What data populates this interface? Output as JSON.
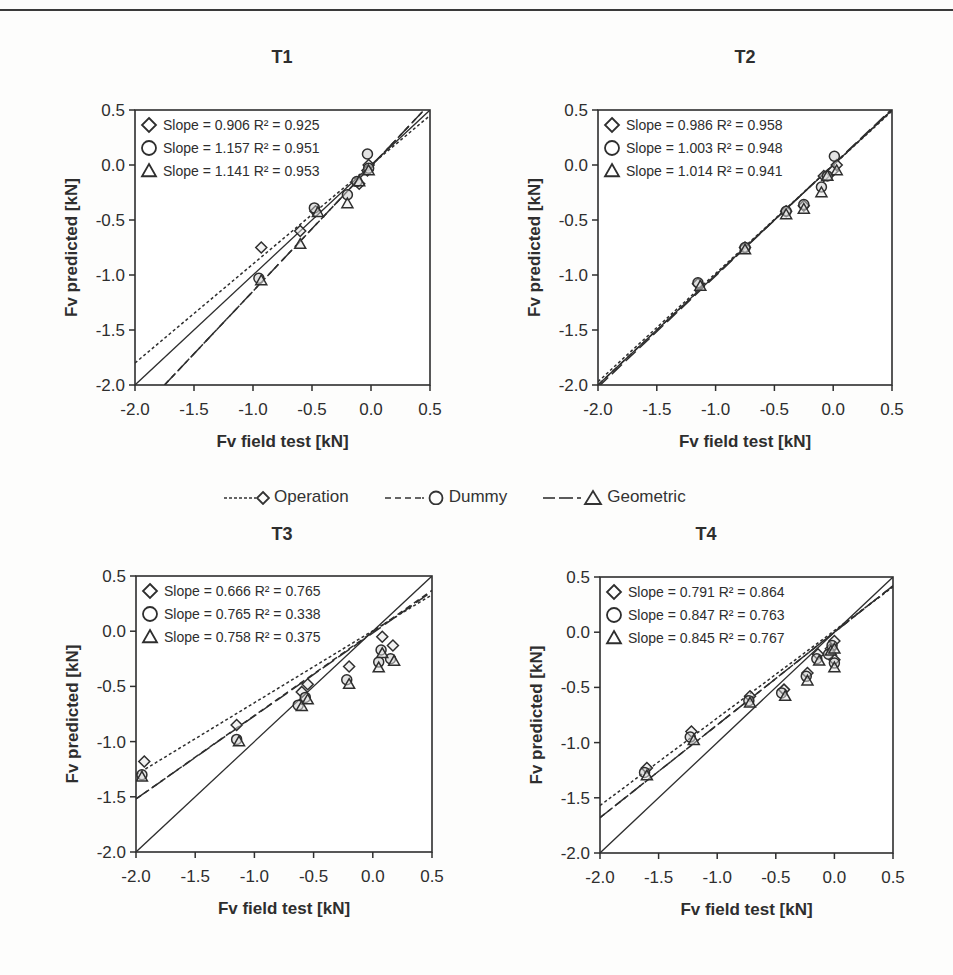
{
  "page": {
    "header_left": "",
    "header_right": ""
  },
  "legend": {
    "items": [
      {
        "label": "Operation",
        "marker": "diamond",
        "line": "short-dash"
      },
      {
        "label": "Dummy",
        "marker": "circle",
        "line": "medium-dash"
      },
      {
        "label": "Geometric",
        "marker": "triangle",
        "line": "long-dash"
      }
    ]
  },
  "chart_data": [
    {
      "type": "scatter",
      "title": "T1",
      "xlabel": "Fv field test [kN]",
      "ylabel": "Fv predicted [kN]",
      "xlim": [
        -2.0,
        0.5
      ],
      "ylim": [
        -2.0,
        0.5
      ],
      "xticks": [
        "-2.0",
        "-1.5",
        "-1.0",
        "-0.5",
        "0.0",
        "0.5"
      ],
      "yticks": [
        "0.5",
        "0.0",
        "-0.5",
        "-1.0",
        "-1.5",
        "-2.0"
      ],
      "grid": false,
      "legend_position": "upper-left inside",
      "series": [
        {
          "name": "Operation",
          "marker": "diamond",
          "slope": 0.906,
          "r2": 0.925,
          "annotation": "Slope = 0.906   R² = 0.925",
          "x": [
            -0.93,
            -0.6,
            -0.47,
            -0.1,
            -0.02,
            -0.03
          ],
          "y": [
            -0.75,
            -0.6,
            -0.42,
            -0.17,
            0.0,
            -0.05
          ]
        },
        {
          "name": "Dummy",
          "marker": "circle",
          "slope": 1.157,
          "r2": 0.951,
          "annotation": "Slope = 1.157   R² = 0.951",
          "x": [
            -0.95,
            -0.48,
            -0.2,
            -0.12,
            -0.03,
            -0.02
          ],
          "y": [
            -1.03,
            -0.39,
            -0.27,
            -0.15,
            0.1,
            -0.03
          ]
        },
        {
          "name": "Geometric",
          "marker": "triangle",
          "slope": 1.141,
          "r2": 0.953,
          "annotation": "Slope = 1.141   R² = 0.953",
          "x": [
            -0.93,
            -0.6,
            -0.45,
            -0.2,
            -0.1,
            -0.02
          ],
          "y": [
            -1.05,
            -0.72,
            -0.43,
            -0.35,
            -0.15,
            -0.05
          ]
        }
      ],
      "fit_lines": [
        {
          "name": "Operation",
          "x": [
            -2.0,
            0.5
          ],
          "y": [
            -1.8,
            0.45
          ]
        },
        {
          "name": "Dummy",
          "x": [
            -1.75,
            0.45
          ],
          "y": [
            -2.0,
            0.5
          ]
        },
        {
          "name": "Geometric",
          "x": [
            -1.75,
            0.45
          ],
          "y": [
            -2.0,
            0.5
          ]
        }
      ]
    },
    {
      "type": "scatter",
      "title": "T2",
      "xlabel": "Fv field test [kN]",
      "ylabel": "Fv predicted [kN]",
      "xlim": [
        -2.0,
        0.5
      ],
      "ylim": [
        -2.0,
        0.5
      ],
      "xticks": [
        "-2.0",
        "-1.5",
        "-1.0",
        "-0.5",
        "0.0",
        "0.5"
      ],
      "yticks": [
        "0.5",
        "0.0",
        "-0.5",
        "-1.0",
        "-1.5",
        "-2.0"
      ],
      "grid": false,
      "legend_position": "upper-left inside",
      "series": [
        {
          "name": "Operation",
          "marker": "diamond",
          "slope": 0.986,
          "r2": 0.958,
          "annotation": "Slope = 0.986  R² = 0.958",
          "x": [
            -1.15,
            -0.75,
            -0.4,
            -0.25,
            -0.08,
            0.0,
            0.03
          ],
          "y": [
            -1.08,
            -0.75,
            -0.42,
            -0.37,
            -0.1,
            -0.05,
            0.0
          ]
        },
        {
          "name": "Dummy",
          "marker": "circle",
          "slope": 1.003,
          "r2": 0.948,
          "annotation": "Slope = 1.003  R² = 0.948",
          "x": [
            -1.15,
            -0.75,
            -0.4,
            -0.25,
            -0.1,
            -0.05,
            0.01
          ],
          "y": [
            -1.07,
            -0.75,
            -0.42,
            -0.36,
            -0.2,
            -0.1,
            0.08
          ]
        },
        {
          "name": "Geometric",
          "marker": "triangle",
          "slope": 1.014,
          "r2": 0.941,
          "annotation": "Slope = 1.014  R² = 0.941",
          "x": [
            -1.13,
            -0.75,
            -0.4,
            -0.25,
            -0.1,
            -0.05,
            0.03
          ],
          "y": [
            -1.1,
            -0.77,
            -0.45,
            -0.4,
            -0.25,
            -0.1,
            -0.05
          ]
        }
      ],
      "fit_lines": [
        {
          "name": "Operation",
          "x": [
            -2.0,
            0.5
          ],
          "y": [
            -1.97,
            0.49
          ]
        },
        {
          "name": "Dummy",
          "x": [
            -2.0,
            0.5
          ],
          "y": [
            -2.0,
            0.5
          ]
        },
        {
          "name": "Geometric",
          "x": [
            -2.0,
            0.5
          ],
          "y": [
            -2.02,
            0.51
          ]
        }
      ]
    },
    {
      "type": "scatter",
      "title": "T3",
      "xlabel": "Fv field test [kN]",
      "ylabel": "Fv predicted [kN]",
      "xlim": [
        -2.0,
        0.5
      ],
      "ylim": [
        -2.0,
        0.5
      ],
      "xticks": [
        "-2.0",
        "-1.5",
        "-1.0",
        "-0.5",
        "0.0",
        "0.5"
      ],
      "yticks": [
        "0.5",
        "0.0",
        "-0.5",
        "-1.0",
        "-1.5",
        "-2.0"
      ],
      "grid": false,
      "legend_position": "upper-left inside",
      "series": [
        {
          "name": "Operation",
          "marker": "diamond",
          "slope": 0.666,
          "r2": 0.765,
          "annotation": "Slope = 0.666  R² = 0.765",
          "x": [
            -1.93,
            -1.15,
            -0.6,
            -0.55,
            -0.2,
            0.08,
            0.17
          ],
          "y": [
            -1.18,
            -0.85,
            -0.55,
            -0.48,
            -0.32,
            -0.05,
            -0.13
          ]
        },
        {
          "name": "Dummy",
          "marker": "circle",
          "slope": 0.765,
          "r2": 0.338,
          "annotation": "Slope = 0.765  R² = 0.338",
          "x": [
            -1.95,
            -1.15,
            -0.63,
            -0.57,
            -0.22,
            0.05,
            0.07,
            0.15
          ],
          "y": [
            -1.3,
            -0.98,
            -0.67,
            -0.6,
            -0.44,
            -0.28,
            -0.17,
            -0.25
          ]
        },
        {
          "name": "Geometric",
          "marker": "triangle",
          "slope": 0.758,
          "r2": 0.375,
          "annotation": "Slope = 0.758  R² = 0.375",
          "x": [
            -1.95,
            -1.13,
            -0.6,
            -0.55,
            -0.2,
            0.05,
            0.08,
            0.18
          ],
          "y": [
            -1.32,
            -1.0,
            -0.68,
            -0.62,
            -0.48,
            -0.33,
            -0.2,
            -0.27
          ]
        }
      ],
      "fit_lines": [
        {
          "name": "Operation",
          "x": [
            -2.0,
            0.5
          ],
          "y": [
            -1.3,
            0.33
          ]
        },
        {
          "name": "Dummy",
          "x": [
            -2.0,
            0.5
          ],
          "y": [
            -1.52,
            0.37
          ]
        },
        {
          "name": "Geometric",
          "x": [
            -2.0,
            0.5
          ],
          "y": [
            -1.52,
            0.36
          ]
        }
      ]
    },
    {
      "type": "scatter",
      "title": "T4",
      "xlabel": "Fv field test [kN]",
      "ylabel": "Fv predicted [kN]",
      "xlim": [
        -2.0,
        0.5
      ],
      "ylim": [
        -2.0,
        0.5
      ],
      "xticks": [
        "-2.0",
        "-1.5",
        "-1.0",
        "-0.5",
        "0.0",
        "0.5"
      ],
      "yticks": [
        "0.5",
        "0.0",
        "-0.5",
        "-1.0",
        "-1.5",
        "-2.0"
      ],
      "grid": false,
      "legend_position": "upper-left inside",
      "series": [
        {
          "name": "Operation",
          "marker": "diamond",
          "slope": 0.791,
          "r2": 0.864,
          "annotation": "Slope = 0.791  R² = 0.864",
          "x": [
            -1.6,
            -1.22,
            -0.72,
            -0.43,
            -0.23,
            -0.14,
            -0.03,
            0.0,
            0.0
          ],
          "y": [
            -1.23,
            -0.9,
            -0.58,
            -0.52,
            -0.37,
            -0.2,
            -0.15,
            -0.08,
            -0.25
          ]
        },
        {
          "name": "Dummy",
          "marker": "circle",
          "slope": 0.847,
          "r2": 0.763,
          "annotation": "Slope = 0.847  R² = 0.763",
          "x": [
            -1.62,
            -1.23,
            -0.73,
            -0.45,
            -0.24,
            -0.15,
            -0.05,
            -0.02,
            0.0
          ],
          "y": [
            -1.27,
            -0.95,
            -0.62,
            -0.55,
            -0.4,
            -0.24,
            -0.2,
            -0.12,
            -0.28
          ]
        },
        {
          "name": "Geometric",
          "marker": "triangle",
          "slope": 0.845,
          "r2": 0.767,
          "annotation": "Slope = 0.845  R² = 0.767",
          "x": [
            -1.6,
            -1.2,
            -0.72,
            -0.42,
            -0.23,
            -0.13,
            -0.03,
            0.0,
            0.0
          ],
          "y": [
            -1.3,
            -0.98,
            -0.64,
            -0.58,
            -0.44,
            -0.26,
            -0.17,
            -0.15,
            -0.32
          ]
        }
      ],
      "fit_lines": [
        {
          "name": "Operation",
          "x": [
            -2.0,
            0.5
          ],
          "y": [
            -1.57,
            0.41
          ]
        },
        {
          "name": "Dummy",
          "x": [
            -2.0,
            0.5
          ],
          "y": [
            -1.68,
            0.42
          ]
        },
        {
          "name": "Geometric",
          "x": [
            -2.0,
            0.5
          ],
          "y": [
            -1.68,
            0.42
          ]
        }
      ]
    }
  ]
}
